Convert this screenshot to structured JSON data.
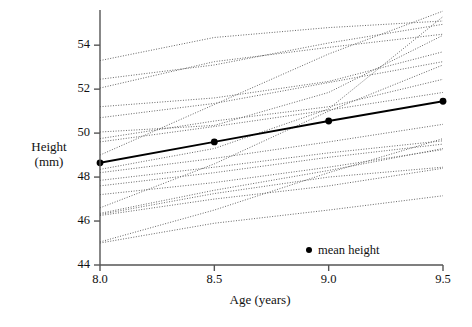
{
  "chart_data": {
    "type": "line",
    "title": "",
    "xlabel": "Age (years)",
    "ylabel": "Height (mm)",
    "ylabel_line1": "Height",
    "ylabel_line2": "(mm)",
    "xlim": [
      8.0,
      9.5
    ],
    "ylim": [
      44,
      55.6
    ],
    "xticks": [
      8.0,
      8.5,
      9.0,
      9.5
    ],
    "xtick_labels": [
      "8.0",
      "8.5",
      "9.0",
      "9.5"
    ],
    "yticks": [
      44,
      46,
      48,
      50,
      52,
      54
    ],
    "ytick_labels": [
      "44",
      "46",
      "48",
      "50",
      "52",
      "54"
    ],
    "grid": false,
    "legend": [
      {
        "label": "mean height",
        "marker": "filled-circle",
        "color": "#000000"
      }
    ],
    "legend_position": "inside-bottom-right",
    "series": [
      {
        "name": "mean height",
        "style": "solid-bold",
        "color": "#000000",
        "marker": "filled-circle",
        "x": [
          8.0,
          8.5,
          9.0,
          9.5
        ],
        "values": [
          48.65,
          49.6,
          50.55,
          51.45
        ]
      },
      {
        "name": "subject-01",
        "style": "dotted",
        "x": [
          8.0,
          8.5,
          9.0,
          9.5
        ],
        "values": [
          53.3,
          54.35,
          54.8,
          55.1
        ]
      },
      {
        "name": "subject-02",
        "style": "dotted",
        "x": [
          8.0,
          8.5,
          9.0,
          9.5
        ],
        "values": [
          52.45,
          53.1,
          54.1,
          54.95
        ]
      },
      {
        "name": "subject-03",
        "style": "dotted",
        "x": [
          8.0,
          8.5,
          9.0,
          9.5
        ],
        "values": [
          52.05,
          53.25,
          53.9,
          54.5
        ]
      },
      {
        "name": "subject-04",
        "style": "dotted",
        "x": [
          8.0,
          8.5,
          9.0,
          9.5
        ],
        "values": [
          51.2,
          51.6,
          52.35,
          53.7
        ]
      },
      {
        "name": "subject-05",
        "style": "dotted",
        "x": [
          8.0,
          8.5,
          9.0,
          9.5
        ],
        "values": [
          50.7,
          51.35,
          52.3,
          53.25
        ]
      },
      {
        "name": "subject-06",
        "style": "dotted",
        "x": [
          8.0,
          8.5,
          9.0,
          9.5
        ],
        "values": [
          49.75,
          50.55,
          51.2,
          52.45
        ]
      },
      {
        "name": "subject-07",
        "style": "dotted",
        "x": [
          8.0,
          8.5,
          9.0,
          9.5
        ],
        "values": [
          49.6,
          50.3,
          51.05,
          51.85
        ]
      },
      {
        "name": "subject-08",
        "style": "dotted",
        "x": [
          8.0,
          8.5,
          9.0,
          9.5
        ],
        "values": [
          48.35,
          49.3,
          51.1,
          55.3
        ]
      },
      {
        "name": "subject-09",
        "style": "dotted",
        "x": [
          8.0,
          8.5,
          9.0,
          9.5
        ],
        "values": [
          48.2,
          48.85,
          49.6,
          50.4
        ]
      },
      {
        "name": "subject-10",
        "style": "dotted",
        "x": [
          8.0,
          8.5,
          9.0,
          9.5
        ],
        "values": [
          47.85,
          48.45,
          49.1,
          49.65
        ]
      },
      {
        "name": "subject-11",
        "style": "dotted",
        "x": [
          8.0,
          8.5,
          9.0,
          9.5
        ],
        "values": [
          47.6,
          48.2,
          48.9,
          49.5
        ]
      },
      {
        "name": "subject-12",
        "style": "dotted",
        "x": [
          8.0,
          8.5,
          9.0,
          9.5
        ],
        "values": [
          47.2,
          47.75,
          48.45,
          49.25
        ]
      },
      {
        "name": "subject-13",
        "style": "dotted",
        "x": [
          8.0,
          8.5,
          9.0,
          9.5
        ],
        "values": [
          46.35,
          47.4,
          48.3,
          49.3
        ]
      },
      {
        "name": "subject-14",
        "style": "dotted",
        "x": [
          8.0,
          8.5,
          9.0,
          9.5
        ],
        "values": [
          46.3,
          47.25,
          48.0,
          48.45
        ]
      },
      {
        "name": "subject-15",
        "style": "dotted",
        "x": [
          8.0,
          8.5,
          9.0,
          9.5
        ],
        "values": [
          46.25,
          47.0,
          47.6,
          48.4
        ]
      },
      {
        "name": "subject-16",
        "style": "dotted",
        "x": [
          8.0,
          8.5,
          9.0,
          9.5
        ],
        "values": [
          45.05,
          46.5,
          48.2,
          49.75
        ]
      },
      {
        "name": "subject-17",
        "style": "dotted",
        "x": [
          8.0,
          8.5,
          9.0,
          9.5
        ],
        "values": [
          45.0,
          45.9,
          46.5,
          47.15
        ]
      },
      {
        "name": "subject-18",
        "style": "dotted",
        "x": [
          8.0,
          8.5,
          9.0,
          9.5
        ],
        "values": [
          49.0,
          51.3,
          53.6,
          55.55
        ]
      },
      {
        "name": "subject-19",
        "style": "dotted",
        "x": [
          8.0,
          8.5,
          9.0,
          9.5
        ],
        "values": [
          46.6,
          48.6,
          51.0,
          53.1
        ]
      },
      {
        "name": "subject-20",
        "style": "dotted",
        "x": [
          8.0,
          8.5,
          9.0,
          9.5
        ],
        "values": [
          50.05,
          50.35,
          51.85,
          54.45
        ]
      }
    ]
  },
  "axes": {
    "y_title_line1": "Height",
    "y_title_line2": "(mm)",
    "x_title": "Age (years)",
    "ytick_44": "44",
    "ytick_46": "46",
    "ytick_48": "48",
    "ytick_50": "50",
    "ytick_52": "52",
    "ytick_54": "54",
    "xtick_80": "8.0",
    "xtick_85": "8.5",
    "xtick_90": "9.0",
    "xtick_95": "9.5"
  },
  "legend": {
    "mean_label": "mean height"
  },
  "colors": {
    "axis": "#555555",
    "mean_line": "#000000",
    "trace": "#666666",
    "background": "#ffffff"
  }
}
